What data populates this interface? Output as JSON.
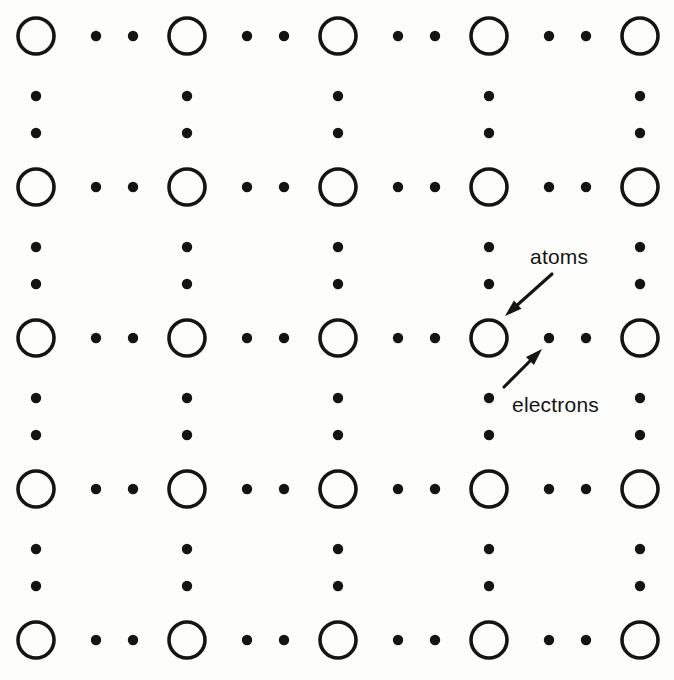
{
  "figure": {
    "background_color": "#fdfdfc",
    "ink_color": "#141414",
    "width": 674,
    "height": 680
  },
  "annotations": [
    {
      "id": "atoms",
      "label": "atoms",
      "label_x": 530,
      "label_y": 264,
      "arrow_from_x": 552,
      "arrow_from_y": 274,
      "arrow_to_x": 505,
      "arrow_to_y": 316
    },
    {
      "id": "electrons",
      "label": "electrons",
      "label_x": 512,
      "label_y": 412,
      "arrow_from_x": 504,
      "arrow_from_y": 387,
      "arrow_to_x": 542,
      "arrow_to_y": 349
    }
  ],
  "lattice": {
    "atom_legend": "atoms",
    "electron_legend": "electrons",
    "atom_radius": 18,
    "atom_stroke_width": 3.6,
    "electron_radius": 5.2,
    "origin_x": 36,
    "origin_y": 36,
    "spacing_x": 151,
    "spacing_y": 151,
    "columns": 5,
    "rows": 5,
    "electrons_per_gap": 2,
    "atom_xs": [
      36,
      187,
      338,
      489,
      640
    ],
    "atom_ys": [
      36,
      187,
      338,
      489,
      640
    ],
    "electron_offsets": [
      60,
      97
    ]
  },
  "chart_data": {
    "type": "scatter",
    "xlabel": "",
    "ylabel": "",
    "grid": false,
    "legend_position": "inline-annotations",
    "series": [
      {
        "name": "atoms",
        "marker": "open-circle",
        "radius_px": 18,
        "x": [
          36,
          187,
          338,
          489,
          640,
          36,
          187,
          338,
          489,
          640,
          36,
          187,
          338,
          489,
          640,
          36,
          187,
          338,
          489,
          640,
          36,
          187,
          338,
          489,
          640
        ],
        "y": [
          36,
          36,
          36,
          36,
          36,
          187,
          187,
          187,
          187,
          187,
          338,
          338,
          338,
          338,
          338,
          489,
          489,
          489,
          489,
          489,
          640,
          640,
          640,
          640,
          640
        ]
      },
      {
        "name": "electrons",
        "marker": "filled-dot",
        "radius_px": 5.2,
        "description": "two electrons evenly spaced along every horizontal and vertical bond between neighbouring atoms"
      }
    ]
  }
}
